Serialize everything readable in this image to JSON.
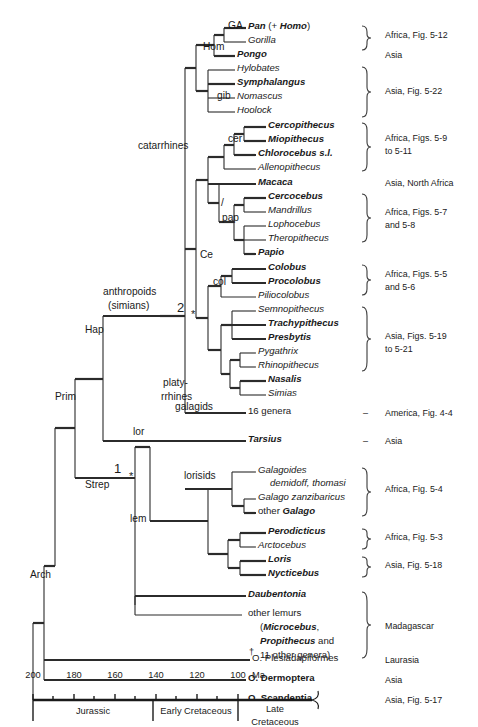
{
  "figure": {
    "type": "phylogenetic-tree",
    "title": "Primate phylogeny with geological timescale"
  },
  "taxa": [
    {
      "id": "pan",
      "label": "Pan (+ Homo)",
      "style": "bold-plus-roman",
      "y": 28,
      "x": 248,
      "bold": true
    },
    {
      "id": "gorilla",
      "label": "Gorilla",
      "style": "italic",
      "y": 42,
      "x": 248,
      "bold": false
    },
    {
      "id": "pongo",
      "label": "Pongo",
      "style": "bold-italic",
      "y": 56,
      "x": 237,
      "bold": true
    },
    {
      "id": "hylobates",
      "label": "Hylobates",
      "style": "italic",
      "y": 70,
      "x": 237,
      "bold": false
    },
    {
      "id": "symphalangus",
      "label": "Symphalangus",
      "style": "bold-italic",
      "y": 84,
      "x": 237,
      "bold": true
    },
    {
      "id": "nomascus",
      "label": "Nomascus",
      "style": "italic",
      "y": 98,
      "x": 237,
      "bold": false
    },
    {
      "id": "hoolock",
      "label": "Hoolock",
      "style": "italic",
      "y": 112,
      "x": 237,
      "bold": false
    },
    {
      "id": "cercopithecus",
      "label": "Cercopithecus",
      "style": "bold-italic",
      "y": 127,
      "x": 268,
      "bold": true
    },
    {
      "id": "miopithecus",
      "label": "Miopithecus",
      "style": "bold-italic",
      "y": 141,
      "x": 268,
      "bold": true
    },
    {
      "id": "chlorocebus",
      "label": "Chlorocebus s.l.",
      "style": "bold-italic",
      "y": 155,
      "x": 258,
      "bold": true
    },
    {
      "id": "allenopithecus",
      "label": "Allenopithecus",
      "style": "italic",
      "y": 169,
      "x": 258,
      "bold": false
    },
    {
      "id": "macaca",
      "label": "Macaca",
      "style": "bold-italic",
      "y": 184,
      "x": 258,
      "bold": true
    },
    {
      "id": "cercocebus",
      "label": "Cercocebus",
      "style": "bold-italic",
      "y": 198,
      "x": 268,
      "bold": true
    },
    {
      "id": "mandrillus",
      "label": "Mandrillus",
      "style": "italic",
      "y": 212,
      "x": 268,
      "bold": false
    },
    {
      "id": "lophocebus",
      "label": "Lophocebus",
      "style": "italic",
      "y": 226,
      "x": 268,
      "bold": false
    },
    {
      "id": "theropithecus",
      "label": "Theropithecus",
      "style": "italic",
      "y": 240,
      "x": 268,
      "bold": false
    },
    {
      "id": "papio",
      "label": "Papio",
      "style": "bold-italic",
      "y": 254,
      "x": 258,
      "bold": true
    },
    {
      "id": "colobus",
      "label": "Colobus",
      "style": "bold-italic",
      "y": 269,
      "x": 268,
      "bold": true
    },
    {
      "id": "procolobus",
      "label": "Procolobus",
      "style": "bold-italic",
      "y": 283,
      "x": 268,
      "bold": true
    },
    {
      "id": "piliocolobus",
      "label": "Piliocolobus",
      "style": "italic",
      "y": 297,
      "x": 258,
      "bold": false
    },
    {
      "id": "semnopithecus",
      "label": "Semnopithecus",
      "style": "italic",
      "y": 311,
      "x": 258,
      "bold": false
    },
    {
      "id": "trachypithecus",
      "label": "Trachypithecus",
      "style": "bold-italic",
      "y": 325,
      "x": 268,
      "bold": true
    },
    {
      "id": "presbytis",
      "label": "Presbytis",
      "style": "bold-italic",
      "y": 339,
      "x": 268,
      "bold": true
    },
    {
      "id": "pygathrix",
      "label": "Pygathrix",
      "style": "italic",
      "y": 353,
      "x": 258,
      "bold": false
    },
    {
      "id": "rhinopithecus",
      "label": "Rhinopithecus",
      "style": "italic",
      "y": 367,
      "x": 258,
      "bold": false
    },
    {
      "id": "nasalis",
      "label": "Nasalis",
      "style": "bold-italic",
      "y": 381,
      "x": 268,
      "bold": true
    },
    {
      "id": "simias",
      "label": "Simias",
      "style": "italic",
      "y": 395,
      "x": 268,
      "bold": false
    },
    {
      "id": "16genera",
      "label": "16 genera",
      "style": "roman",
      "y": 413,
      "x": 248,
      "bold": false
    },
    {
      "id": "tarsius",
      "label": "Tarsius",
      "style": "bold-italic",
      "y": 441,
      "x": 248,
      "bold": true
    },
    {
      "id": "galagoides",
      "label": "Galagoides",
      "style": "italic",
      "y": 472,
      "x": 258,
      "bold": false
    },
    {
      "id": "galagoides2",
      "label": "demidoff, thomasi",
      "style": "italic-indent",
      "y": 485,
      "x": 270,
      "bold": false
    },
    {
      "id": "galagozanz",
      "label": "Galago zanzibaricus",
      "style": "italic",
      "y": 499,
      "x": 258,
      "bold": false
    },
    {
      "id": "othergalago",
      "label": "other Galago",
      "style": "roman-bold-part",
      "y": 513,
      "x": 258,
      "bold": true
    },
    {
      "id": "perodicticus",
      "label": "Perodicticus",
      "style": "bold-italic",
      "y": 533,
      "x": 268,
      "bold": true
    },
    {
      "id": "arctocebus",
      "label": "Arctocebus",
      "style": "italic",
      "y": 547,
      "x": 258,
      "bold": false
    },
    {
      "id": "loris",
      "label": "Loris",
      "style": "bold-italic",
      "y": 561,
      "x": 268,
      "bold": true
    },
    {
      "id": "nycticebus",
      "label": "Nycticebus",
      "style": "bold-italic",
      "y": 575,
      "x": 268,
      "bold": true
    },
    {
      "id": "daubentonia",
      "label": "Daubentonia",
      "style": "bold-italic",
      "y": 596,
      "x": 248,
      "bold": true
    },
    {
      "id": "otherlemurs",
      "label": "other lemurs",
      "style": "roman",
      "y": 615,
      "x": 248,
      "bold": false
    },
    {
      "id": "otherlemurs2",
      "label": "(Microcebus,",
      "style": "roman-bold-part",
      "y": 629,
      "x": 260,
      "bold": true
    },
    {
      "id": "otherlemurs3",
      "label": "Propithecus and",
      "style": "roman-bold-part",
      "y": 643,
      "x": 260,
      "bold": true
    },
    {
      "id": "otherlemurs4",
      "label": "11 other genera)",
      "style": "roman",
      "y": 657,
      "x": 260,
      "bold": false
    },
    {
      "id": "plesiadapiformes",
      "label": "O. Plesiadapiformes",
      "style": "roman",
      "y": 660,
      "x": 252,
      "bold": false
    },
    {
      "id": "dermoptera",
      "label": "O. Dermoptera",
      "style": "bold",
      "y": 680,
      "x": 248,
      "bold": true
    },
    {
      "id": "scandentia",
      "label": "O. Scandentia",
      "style": "bold",
      "y": 700,
      "x": 248,
      "bold": true
    }
  ],
  "node_labels": [
    {
      "id": "ga",
      "label": "GA",
      "x": 228,
      "y": 28
    },
    {
      "id": "hom",
      "label": "Hom",
      "x": 203,
      "y": 49
    },
    {
      "id": "gib",
      "label": "gib",
      "x": 217,
      "y": 98
    },
    {
      "id": "cer",
      "label": "cer",
      "x": 228,
      "y": 141
    },
    {
      "id": "pap",
      "label": "pap",
      "x": 222,
      "y": 220
    },
    {
      "id": "slash",
      "label": "/",
      "x": 221,
      "y": 205
    },
    {
      "id": "catarrhines",
      "label": "catarrhines",
      "x": 138,
      "y": 148
    },
    {
      "id": "ce",
      "label": "Ce",
      "x": 200,
      "y": 257
    },
    {
      "id": "col",
      "label": "col",
      "x": 213,
      "y": 284
    },
    {
      "id": "anthropoids",
      "label": "anthropoids",
      "x": 103,
      "y": 294
    },
    {
      "id": "simians",
      "label": "(simians)",
      "x": 108,
      "y": 308
    },
    {
      "id": "two",
      "label": "2",
      "x": 177,
      "y": 308
    },
    {
      "id": "star2",
      "label": "*",
      "x": 191,
      "y": 316
    },
    {
      "id": "platy",
      "label": "platy-",
      "x": 163,
      "y": 385
    },
    {
      "id": "rrhines",
      "label": "rrhines",
      "x": 161,
      "y": 399
    },
    {
      "id": "hap",
      "label": "Hap",
      "x": 85,
      "y": 332
    },
    {
      "id": "prim",
      "label": "Prim",
      "x": 55,
      "y": 399
    },
    {
      "id": "galagids",
      "label": "galagids",
      "x": 175,
      "y": 409
    },
    {
      "id": "lor",
      "label": "lor",
      "x": 133,
      "y": 434
    },
    {
      "id": "one",
      "label": "1",
      "x": 114,
      "y": 469
    },
    {
      "id": "star1",
      "label": "*",
      "x": 129,
      "y": 478
    },
    {
      "id": "lorisids",
      "label": "lorisids",
      "x": 184,
      "y": 478
    },
    {
      "id": "strep",
      "label": "Strep",
      "x": 85,
      "y": 487
    },
    {
      "id": "lem",
      "label": "lem",
      "x": 130,
      "y": 521
    },
    {
      "id": "arch",
      "label": "Arch",
      "x": 30,
      "y": 577
    }
  ],
  "regions": [
    {
      "id": "r-africa-512",
      "label": "Africa, Fig. 5-12",
      "x": 385,
      "y": 38
    },
    {
      "id": "r-asia-1",
      "label": "Asia",
      "x": 385,
      "y": 58
    },
    {
      "id": "r-asia-522",
      "label": "Asia, Fig. 5-22",
      "x": 385,
      "y": 94
    },
    {
      "id": "r-africa-59a",
      "label": "Africa, Figs. 5-9",
      "x": 385,
      "y": 141
    },
    {
      "id": "r-africa-59b",
      "label": "to 5-11",
      "x": 385,
      "y": 154
    },
    {
      "id": "r-asia-na",
      "label": "Asia, North Africa",
      "x": 385,
      "y": 186
    },
    {
      "id": "r-africa-57a",
      "label": "Africa, Figs. 5-7",
      "x": 385,
      "y": 215
    },
    {
      "id": "r-africa-57b",
      "label": "and 5-8",
      "x": 385,
      "y": 228
    },
    {
      "id": "r-africa-55a",
      "label": "Africa, Figs. 5-5",
      "x": 385,
      "y": 277
    },
    {
      "id": "r-africa-55b",
      "label": "and 5-6",
      "x": 385,
      "y": 290
    },
    {
      "id": "r-asia-519a",
      "label": "Asia, Figs. 5-19",
      "x": 385,
      "y": 339
    },
    {
      "id": "r-asia-519b",
      "label": "to 5-21",
      "x": 385,
      "y": 352
    },
    {
      "id": "r-america",
      "label": "America, Fig. 4-4",
      "x": 385,
      "y": 416
    },
    {
      "id": "r-asia-2",
      "label": "Asia",
      "x": 385,
      "y": 444
    },
    {
      "id": "r-africa-54",
      "label": "Africa, Fig. 5-4",
      "x": 385,
      "y": 492
    },
    {
      "id": "r-africa-53",
      "label": "Africa, Fig. 5-3",
      "x": 385,
      "y": 540
    },
    {
      "id": "r-asia-518",
      "label": "Asia, Fig. 5-18",
      "x": 385,
      "y": 568
    },
    {
      "id": "r-madagascar",
      "label": "Madagascar",
      "x": 385,
      "y": 629
    },
    {
      "id": "r-laurasia",
      "label": "Laurasia",
      "x": 385,
      "y": 663
    },
    {
      "id": "r-asia-3",
      "label": "Asia",
      "x": 385,
      "y": 683
    },
    {
      "id": "r-asia-517",
      "label": "Asia, Fig. 5-17",
      "x": 385,
      "y": 703
    }
  ],
  "dashes": [
    {
      "id": "dash-america",
      "label": "–",
      "x": 363,
      "y": 416
    },
    {
      "id": "dash-asia",
      "label": "–",
      "x": 363,
      "y": 444
    }
  ],
  "dagger": {
    "label": "†",
    "x": 249,
    "y": 654
  },
  "timescale": {
    "type": "axis",
    "unit_label": "Ma",
    "ticks_major": [
      200,
      180,
      160,
      140,
      120,
      100
    ],
    "ticks_minor": [
      190,
      170,
      150,
      130,
      110
    ],
    "axis_start_ma": 200,
    "axis_end_ma": 95,
    "eras": [
      {
        "id": "jurassic",
        "label": "Jurassic",
        "start_ma": 200,
        "end_ma": 145
      },
      {
        "id": "early-cretaceous",
        "label": "Early Cretaceous",
        "start_ma": 145,
        "end_ma": 100
      },
      {
        "id": "late-cretaceous-1",
        "label": "Late",
        "start_ma": 100,
        "end_ma": 95
      },
      {
        "id": "late-cretaceous-2",
        "label": "Cretaceous",
        "start_ma": 100,
        "end_ma": 95
      }
    ]
  }
}
